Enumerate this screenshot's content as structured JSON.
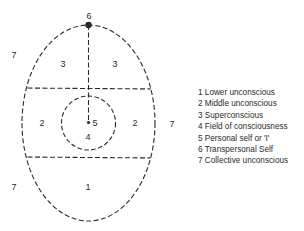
{
  "diagram": {
    "region_labels": {
      "top": "6",
      "upper_left": "3",
      "upper_right": "3",
      "middle_left": "2",
      "middle_right": "2",
      "center_self": "5",
      "center_field": "4",
      "bottom": "1",
      "outside_top_left": "7",
      "outside_right": "7",
      "outside_bottom_left": "7"
    },
    "colors": {
      "line": "#2a2a2a",
      "background": "#ffffff"
    }
  },
  "legend": {
    "items": [
      {
        "label": "1 Lower unconscious"
      },
      {
        "label": "2 Middle unconscious"
      },
      {
        "label": "3 Superconscious"
      },
      {
        "label": "4 Field of consciousness"
      },
      {
        "label": "5 Personal self or 'I'"
      },
      {
        "label": "6 Transpersonal Self"
      },
      {
        "label": "7 Collective unconscious"
      }
    ]
  }
}
